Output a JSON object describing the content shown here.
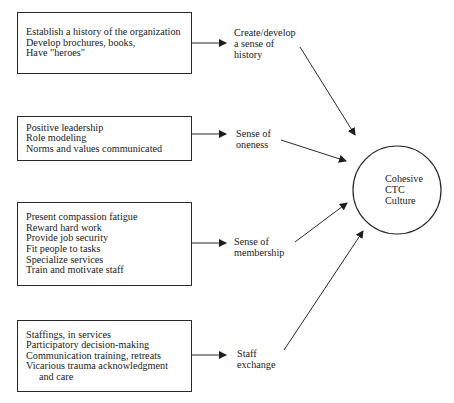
{
  "diagram": {
    "type": "flow-diagram",
    "target": {
      "lines": [
        "Cohesive",
        "CTC",
        "Culture"
      ]
    },
    "groups": [
      {
        "box_items": [
          "Establish a history of the organization",
          "Develop brochures, books,",
          "Have \"heroes\""
        ],
        "outcome_lines": [
          "Create/develop",
          "a sense of",
          "history"
        ]
      },
      {
        "box_items": [
          "Positive leadership",
          "Role modeling",
          "Norms and values communicated"
        ],
        "outcome_lines": [
          "Sense of",
          "oneness"
        ]
      },
      {
        "box_items": [
          "Present compassion fatigue",
          "Reward hard work",
          "Provide job security",
          "Fit people to tasks",
          "Specialize services",
          "Train and motivate staff"
        ],
        "outcome_lines": [
          "Sense of",
          "membership"
        ]
      },
      {
        "box_items": [
          "Staffings, in services",
          "Participatory decision-making",
          "Communication training, retreats",
          "Vicarious trauma acknowledgment",
          "and care"
        ],
        "outcome_lines": [
          "Staff",
          "exchange"
        ]
      }
    ],
    "colors": {
      "ink": "#2a2a2a",
      "background": "#ffffff"
    }
  }
}
